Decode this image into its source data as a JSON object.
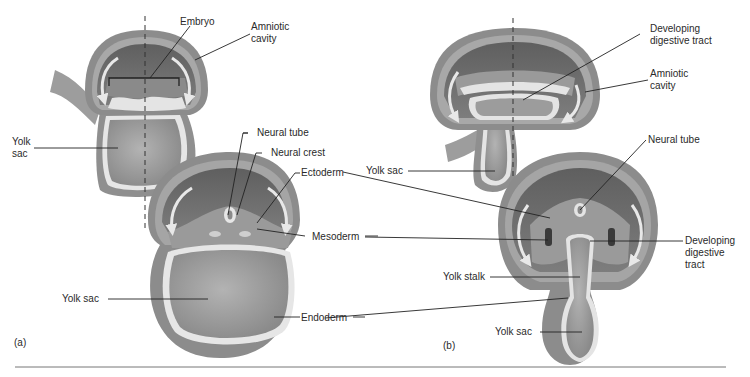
{
  "figure": {
    "panels": [
      {
        "id": "a",
        "label": "(a)",
        "upper_embryo_labels": {
          "embryo": "Embryo",
          "amniotic_cavity": "Amniotic\ncavity",
          "yolk_sac": "Yolk\nsac"
        },
        "cross_section_labels": {
          "neural_tube": "Neural tube",
          "neural_crest": "Neural crest",
          "ectoderm": "Ectoderm",
          "mesoderm": "Mesoderm",
          "yolk_sac": "Yolk sac",
          "endoderm": "Endoderm"
        }
      },
      {
        "id": "b",
        "label": "(b)",
        "upper_embryo_labels": {
          "developing_digestive_tract": "Developing\ndigestive tract",
          "amniotic_cavity": "Amniotic\ncavity",
          "yolk_sac": "Yolk sac"
        },
        "cross_section_labels": {
          "neural_tube": "Neural tube",
          "developing_digestive_tract": "Developing\ndigestive\ntract",
          "yolk_stalk": "Yolk stalk",
          "yolk_sac": "Yolk sac"
        }
      }
    ],
    "colors": {
      "outer_layer": "#8c8c8c",
      "mid_layer": "#a9a9a9",
      "cavity_dark": "#6e6e6e",
      "yolk_fill": "#9a9a9a",
      "highlight": "#e6e6e6",
      "leader_line": "#222222",
      "separator": "#777777"
    }
  }
}
